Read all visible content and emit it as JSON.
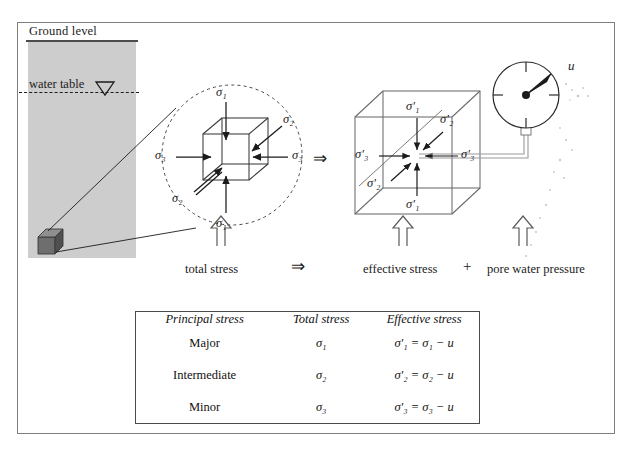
{
  "figure": {
    "title_elements": {
      "ground_level": "Ground level",
      "water_table": "water table"
    },
    "stage_captions": {
      "total": "total stress",
      "effective": "effective stress",
      "pore": "pore water pressure"
    },
    "operators": {
      "implies_1": "⇒",
      "implies_2": "⇒",
      "plus": "+"
    },
    "left_cube_labels": {
      "top": "σ₁",
      "bottom": "σ₁",
      "left": "σ₃",
      "right": "σ₃",
      "back": "σ₂",
      "front": "σ₂"
    },
    "right_cube_labels": {
      "top": "σ′₁",
      "bottom": "σ′₁",
      "left": "σ′₃",
      "right": "σ′₃",
      "back": "σ′₂",
      "front": "σ′₂"
    },
    "gauge": {
      "label": "u",
      "needle_angle_deg": -38
    },
    "colors": {
      "soil_fill": "#cdcdcd",
      "line": "#2b2b2b",
      "frame": "#7d7d7d",
      "soil_cube_face": "#6e6e6e",
      "soil_cube_top": "#8c8c8c",
      "soil_cube_side": "#4f4f4f"
    }
  },
  "table": {
    "headers": [
      "Principal stress",
      "Total stress",
      "Effective stress"
    ],
    "rows": [
      {
        "principal": "Major",
        "total": "σ₁",
        "effective": "σ′₁ = σ₁ − u"
      },
      {
        "principal": "Intermediate",
        "total": "σ₂",
        "effective": "σ′₂ = σ₂ − u"
      },
      {
        "principal": "Minor",
        "total": "σ₃",
        "effective": "σ′₃ = σ₃ − u"
      }
    ]
  }
}
